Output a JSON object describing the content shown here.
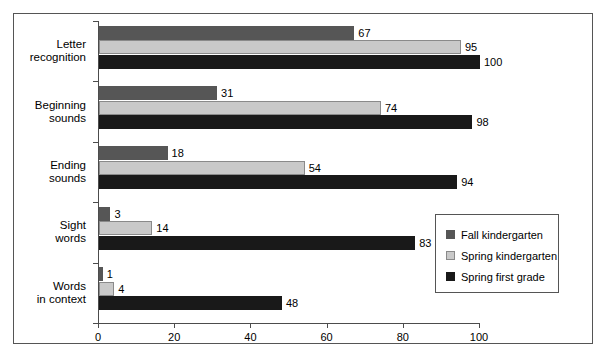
{
  "chart_data": {
    "type": "bar",
    "orientation": "horizontal",
    "title": "",
    "subtitle": "",
    "xlabel": "",
    "ylabel": "",
    "xlim": [
      0,
      100
    ],
    "xticks": [
      0,
      20,
      40,
      60,
      80,
      100
    ],
    "xticklabels": [
      "0",
      "20",
      "40",
      "60",
      "80",
      "100"
    ],
    "grid": false,
    "legend_position": "inside-lower-right",
    "categories": [
      "Letter\nrecognition",
      "Beginning\nsounds",
      "Ending\nsounds",
      "Sight\nwords",
      "Words\nin context"
    ],
    "category_lines": [
      [
        "Letter",
        "recognition"
      ],
      [
        "Beginning",
        "sounds"
      ],
      [
        "Ending",
        "sounds"
      ],
      [
        "Sight",
        "words"
      ],
      [
        "Words",
        "in context"
      ]
    ],
    "series": [
      {
        "name": "Fall kindergarten",
        "color": "#565656",
        "values": [
          67,
          31,
          18,
          3,
          1
        ],
        "labels": [
          "67",
          "31",
          "18",
          "3",
          "1"
        ]
      },
      {
        "name": "Spring kindergarten",
        "color": "#c9c9c9",
        "values": [
          95,
          74,
          54,
          14,
          4
        ],
        "labels": [
          "95",
          "74",
          "54",
          "14",
          "4"
        ]
      },
      {
        "name": "Spring first grade",
        "color": "#191919",
        "values": [
          100,
          98,
          94,
          83,
          48
        ],
        "labels": [
          "100",
          "98",
          "94",
          "83",
          "48"
        ]
      }
    ]
  },
  "legend": {
    "items": [
      {
        "label": "Fall kindergarten"
      },
      {
        "label": "Spring kindergarten"
      },
      {
        "label": "Spring first grade"
      }
    ]
  }
}
